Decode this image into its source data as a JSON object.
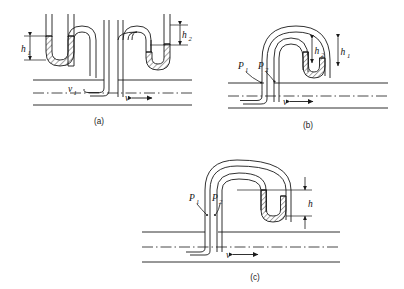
{
  "figure": {
    "line_color": "#1a1a1a",
    "hatch_color": "#333333",
    "background": "#ffffff"
  },
  "panels": [
    {
      "id": "a",
      "caption": "(a)",
      "description": "Multiple-loop inverted manometer with two mercury-filled U-bends above a horizontal pipe",
      "labels": [
        {
          "name": "h1",
          "base": "h",
          "sub": "1"
        },
        {
          "name": "h2",
          "base": "h",
          "sub": "2"
        },
        {
          "name": "v1",
          "base": "v",
          "sub": "1"
        },
        {
          "name": "v",
          "base": "v",
          "sub": ""
        }
      ]
    },
    {
      "id": "b",
      "caption": "(b)",
      "description": "Nested inverted-U manometer with mercury seal, pressure taps P1 and P2 on pipe",
      "labels": [
        {
          "name": "h1",
          "base": "h",
          "sub": "1"
        },
        {
          "name": "h2",
          "base": "h",
          "sub": "2"
        },
        {
          "name": "P1",
          "base": "P",
          "sub": "1"
        },
        {
          "name": "P2",
          "base": "P",
          "sub": "2"
        },
        {
          "name": "v",
          "base": "v",
          "sub": ""
        }
      ]
    },
    {
      "id": "c",
      "caption": "(c)",
      "description": "Single inverted-U manometer with mercury column of height h, pressure taps P1 and P2",
      "labels": [
        {
          "name": "h",
          "base": "h",
          "sub": ""
        },
        {
          "name": "P1",
          "base": "P",
          "sub": "1"
        },
        {
          "name": "P2",
          "base": "P",
          "sub": "2"
        },
        {
          "name": "v",
          "base": "v",
          "sub": ""
        }
      ]
    }
  ]
}
